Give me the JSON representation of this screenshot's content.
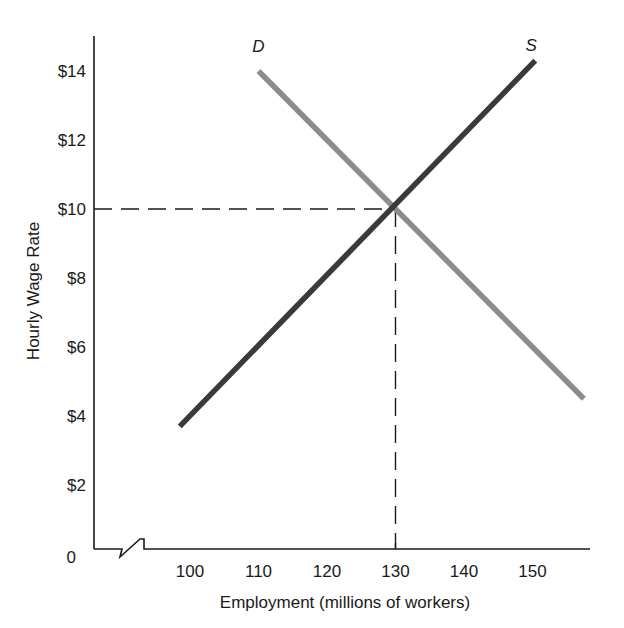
{
  "chart_data": {
    "type": "line",
    "title": "",
    "xlabel": "Employment (millions of workers)",
    "ylabel": "Hourly Wage Rate",
    "xlim": [
      90,
      160
    ],
    "ylim": [
      0,
      15
    ],
    "x_ticks": [
      100,
      110,
      120,
      130,
      140,
      150
    ],
    "x_tick_labels": [
      "100",
      "110",
      "120",
      "130",
      "140",
      "150"
    ],
    "y_ticks": [
      0,
      2,
      4,
      6,
      8,
      10,
      12,
      14
    ],
    "y_tick_labels": [
      "0",
      "$2",
      "$4",
      "$6",
      "$8",
      "$10",
      "$12",
      "$14"
    ],
    "axis_break": "x-axis",
    "grid": false,
    "series": [
      {
        "name": "S",
        "label": "S",
        "color": "#3a3a3a",
        "x": [
          98.5,
          150.4
        ],
        "y": [
          3.7,
          14.3
        ]
      },
      {
        "name": "D",
        "label": "D",
        "color": "#8c8c8c",
        "x": [
          110,
          157.5
        ],
        "y": [
          14.0,
          4.5
        ]
      }
    ],
    "annotations": [
      {
        "type": "equilibrium",
        "x": 130,
        "y": 10,
        "guide_lines": "dashed"
      }
    ]
  }
}
